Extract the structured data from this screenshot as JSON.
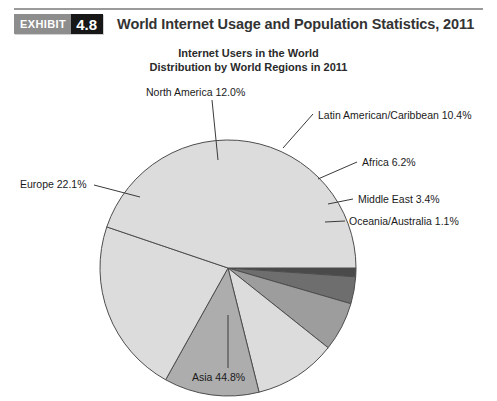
{
  "header": {
    "badge_word": "EXHIBIT",
    "badge_number": "4.8",
    "title": "World Internet Usage and Population Statistics, 2011"
  },
  "chart_data": {
    "type": "pie",
    "title": "Internet Users in the World",
    "subtitle": "Distribution by World Regions in 2011",
    "xlabel": "",
    "ylabel": "",
    "unit": "%",
    "legend_position": "callout-labels",
    "grid": false,
    "start_angle_deg": 0,
    "direction": "clockwise",
    "categories": [
      "Oceania/Australia",
      "Middle East",
      "Africa",
      "Latin American/Caribbean",
      "North America",
      "Europe",
      "Asia"
    ],
    "values": [
      1.1,
      3.4,
      6.2,
      10.4,
      12.0,
      22.1,
      44.8
    ],
    "slices": [
      {
        "label": "Oceania/Australia 1.1%",
        "name": "Oceania/Australia",
        "value": 1.1,
        "color": "#4a4a4a"
      },
      {
        "label": "Middle East 3.4%",
        "name": "Middle East",
        "value": 3.4,
        "color": "#6e6e6e"
      },
      {
        "label": "Africa 6.2%",
        "name": "Africa",
        "value": 6.2,
        "color": "#9d9d9d"
      },
      {
        "label": "Latin American/Caribbean 10.4%",
        "name": "Latin American/Caribbean",
        "value": 10.4,
        "color": "#dcdcdc"
      },
      {
        "label": "North America 12.0%",
        "name": "North America",
        "value": 12.0,
        "color": "#adadad"
      },
      {
        "label": "Europe 22.1%",
        "name": "Europe",
        "value": 22.1,
        "color": "#dcdcdc"
      },
      {
        "label": "Asia 44.8%",
        "name": "Asia",
        "value": 44.8,
        "color": "#dcdcdc"
      }
    ]
  },
  "labels": {
    "north_america": "North America 12.0%",
    "latin_america": "Latin American/Caribbean 10.4%",
    "africa": "Africa 6.2%",
    "middle_east": "Middle East 3.4%",
    "oceania": "Oceania/Australia 1.1%",
    "europe": "Europe 22.1%",
    "asia": "Asia 44.8%"
  }
}
